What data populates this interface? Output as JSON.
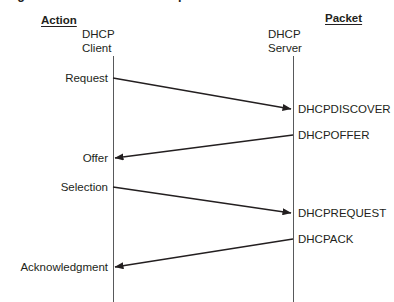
{
  "figure": {
    "caption": "Figure 13-1   The DHCP lease process"
  },
  "columns": {
    "left_header": "Action",
    "right_header": "Packet"
  },
  "lifelines": [
    {
      "name": "client",
      "label": "DHCP\nClient",
      "line1": "DHCP",
      "line2": "Client",
      "x": 113
    },
    {
      "name": "server",
      "label": "DHCP\nServer",
      "line1": "DHCP",
      "line2": "Server",
      "x": 293
    }
  ],
  "messages": [
    {
      "action": "Request",
      "packet": "DHCPDISCOVER",
      "direction": "client-to-server",
      "start_x": 113,
      "start_y": 78,
      "end_x": 291,
      "end_y": 109
    },
    {
      "action": "Offer",
      "packet": "DHCPOFFER",
      "direction": "server-to-client",
      "start_x": 293,
      "start_y": 135,
      "end_x": 115,
      "end_y": 158
    },
    {
      "action": "Selection",
      "packet": "DHCPREQUEST",
      "direction": "client-to-server",
      "start_x": 113,
      "start_y": 187,
      "end_x": 291,
      "end_y": 213
    },
    {
      "action": "Acknowledgment",
      "packet": "DHCPACK",
      "direction": "server-to-client",
      "start_x": 293,
      "start_y": 239,
      "end_x": 115,
      "end_y": 267
    }
  ],
  "colors": {
    "background": "#ffffff",
    "line": "#231f20",
    "lifeline": "#58595b",
    "text": "#231f20"
  }
}
